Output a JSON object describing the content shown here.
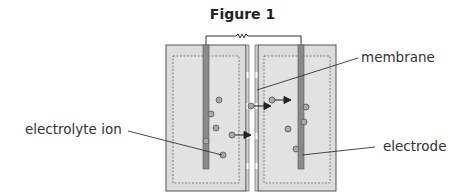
{
  "figure": {
    "title": "Figure 1",
    "labels": {
      "membrane": "membrane",
      "electrolyte_ion": "electrolyte ion",
      "electrode": "electrode"
    },
    "colors": {
      "container_fill": "#dcdcdc",
      "container_stroke": "#555555",
      "electrode_fill": "#8a8a8a",
      "ion_fill": "#a8a8a8",
      "line": "#333333"
    }
  }
}
